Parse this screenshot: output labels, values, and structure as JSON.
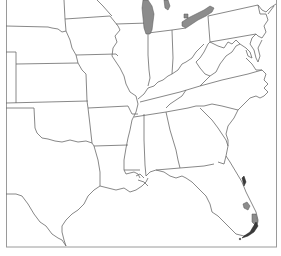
{
  "map": {
    "type": "outline map",
    "region": "Eastern United States",
    "features": [
      "state boundaries",
      "shaded areas"
    ],
    "shaded_areas": [
      {
        "name": "lake-michigan",
        "color": "#8c8c8c"
      },
      {
        "name": "lake-erie",
        "color": "#8c8c8c"
      },
      {
        "name": "florida-east-coast-patch",
        "color": "#555555"
      },
      {
        "name": "lake-okeechobee",
        "color": "#a0a0a0"
      },
      {
        "name": "south-florida-patch",
        "color": "#8c8c8c"
      },
      {
        "name": "florida-keys",
        "color": "#3a3a3a"
      }
    ],
    "colors": {
      "background": "#ffffff",
      "outline": "#6a6a6a",
      "frame": "#9a9a9a"
    }
  }
}
